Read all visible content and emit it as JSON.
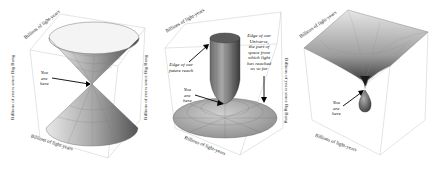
{
  "figure": {
    "panels": [
      {
        "id": "light-cone",
        "surface": "double cone",
        "x_axis_label": "Billions of light-years",
        "y_axis_label": "Billions of light-years",
        "z_axis_label": "Billions of years since Big Bang",
        "annotations": [
          {
            "text": "You\nare\nhere",
            "points_to": "cone apex"
          }
        ],
        "ticks": [
          "-10",
          "0",
          "10"
        ]
      },
      {
        "id": "expanding-universe",
        "surface": "narrow vase over flat disk",
        "x_axis_label": "Billions of light-years",
        "y_axis_label": "Billions of light-years",
        "z_axis_label": "Billions of years since Big Bang",
        "annotations": [
          {
            "text": "Edge of our\nfuture reach",
            "points_to": "vase wall"
          },
          {
            "text": "Edge of our\nUniverse,\nthe part of\nspace from\nwhich light\nhas reached\nus so far",
            "points_to": "disk edge"
          },
          {
            "text": "You\nare\nhere",
            "points_to": "vase bottom"
          }
        ],
        "ticks": [
          "-50",
          "-25",
          "0",
          "25",
          "50"
        ]
      },
      {
        "id": "accelerating-universe",
        "surface": "wide bowl with teardrop",
        "x_axis_label": "Billions of light-years",
        "y_axis_label": "Billions of light-years",
        "z_axis_label": "Billions of years since Big Bang",
        "annotations": [
          {
            "text": "You\nare\nhere",
            "points_to": "teardrop top"
          }
        ],
        "ticks": [
          "-20",
          "0",
          "20"
        ]
      }
    ]
  }
}
